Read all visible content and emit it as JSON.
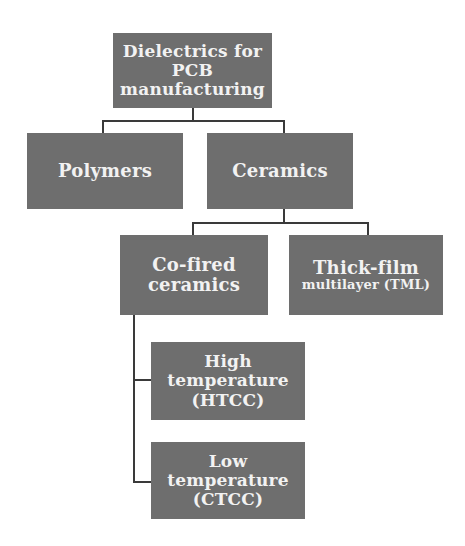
{
  "diagram": {
    "title": "Dielectrics for PCB manufacturing",
    "colors": {
      "box_fill": "#6e6e6e",
      "box_text": "#f2f2f2",
      "connector": "#3a3a3a",
      "background": "#ffffff"
    },
    "nodes": {
      "root": {
        "line1": "Dielectrics for",
        "line2": "PCB",
        "line3": "manufacturing"
      },
      "polymers": {
        "label": "Polymers"
      },
      "ceramics": {
        "label": "Ceramics"
      },
      "cofired": {
        "line1": "Co-fired",
        "line2": "ceramics"
      },
      "thickfilm": {
        "line1": "Thick-film",
        "line2": "multilayer (TML)"
      },
      "htcc": {
        "line1": "High",
        "line2": "temperature",
        "line3": "(HTCC)"
      },
      "ctcc": {
        "line1": "Low",
        "line2": "temperature",
        "line3": "(CTCC)"
      }
    },
    "edges": [
      [
        "root",
        "polymers"
      ],
      [
        "root",
        "ceramics"
      ],
      [
        "ceramics",
        "cofired"
      ],
      [
        "ceramics",
        "thickfilm"
      ],
      [
        "cofired",
        "htcc"
      ],
      [
        "cofired",
        "ctcc"
      ]
    ]
  }
}
